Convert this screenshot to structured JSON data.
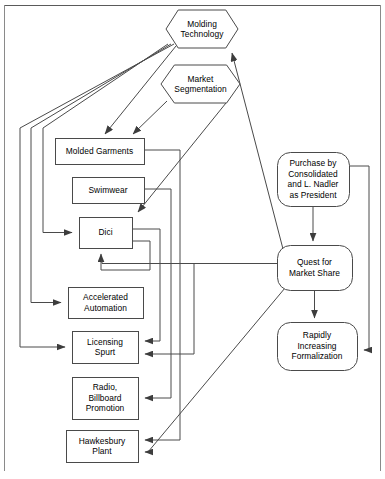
{
  "diagram": {
    "type": "flow-diagram",
    "stroke_color": "#4a4a4a",
    "text_color": "#000000",
    "background_color": "#ffffff",
    "nodes": [
      {
        "id": "molding_technology",
        "label": "Molding\nTechnology",
        "shape": "hexagon",
        "x": 166,
        "y": 10,
        "w": 72,
        "h": 38
      },
      {
        "id": "market_segmentation",
        "label": "Market\nSegmentation",
        "shape": "hexagon",
        "x": 161,
        "y": 65,
        "w": 79,
        "h": 38
      },
      {
        "id": "molded_garments",
        "label": "Molded Garments",
        "shape": "rect",
        "x": 55,
        "y": 138,
        "w": 89,
        "h": 26
      },
      {
        "id": "swimwear",
        "label": "Swimwear",
        "shape": "rect",
        "x": 72,
        "y": 177,
        "w": 72,
        "h": 26
      },
      {
        "id": "dici",
        "label": "Dici",
        "shape": "rect",
        "x": 79,
        "y": 217,
        "w": 53,
        "h": 31
      },
      {
        "id": "accelerated_automation",
        "label": "Accelerated\nAutomation",
        "shape": "rect",
        "x": 68,
        "y": 287,
        "w": 75,
        "h": 31
      },
      {
        "id": "licensing_spurt",
        "label": "Licensing\nSpurt",
        "shape": "rect",
        "x": 72,
        "y": 331,
        "w": 66,
        "h": 32
      },
      {
        "id": "radio_billboard",
        "label": "Radio,\nBillboard\nPromotion",
        "shape": "rect",
        "x": 72,
        "y": 377,
        "w": 66,
        "h": 42
      },
      {
        "id": "hawkesbury_plant",
        "label": "Hawkesbury\nPlant",
        "shape": "rect",
        "x": 66,
        "y": 430,
        "w": 72,
        "h": 32
      },
      {
        "id": "purchase_consolidated",
        "label": "Purchase by\nConsolidated\nand L. Nadler\nas President",
        "shape": "rounded",
        "x": 277,
        "y": 152,
        "w": 72,
        "h": 54
      },
      {
        "id": "quest_market_share",
        "label": "Quest for\nMarket Share",
        "shape": "rounded",
        "x": 277,
        "y": 245,
        "w": 75,
        "h": 45
      },
      {
        "id": "rapidly_formalization",
        "label": "Rapidly\nIncreasing\nFormalization",
        "shape": "rounded",
        "x": 277,
        "y": 322,
        "w": 80,
        "h": 48
      }
    ],
    "edges": [
      {
        "from": "molding_technology",
        "to": "molded_garments",
        "kind": "diagonal-arrow"
      },
      {
        "from": "market_segmentation",
        "to": "molded_garments",
        "kind": "diagonal-arrow"
      },
      {
        "from": "market_segmentation",
        "to": "dici",
        "kind": "diagonal-arrow"
      },
      {
        "from": "molding_technology",
        "to": "dici",
        "kind": "left-routed-arrow"
      },
      {
        "from": "molding_technology",
        "to": "accelerated_automation",
        "kind": "left-routed-arrow"
      },
      {
        "from": "molding_technology",
        "to": "licensing_spurt",
        "kind": "left-routed-arrow"
      },
      {
        "from": "molded_garments",
        "to": "hawkesbury_plant",
        "kind": "right-routed-arrow"
      },
      {
        "from": "swimwear",
        "to": "radio_billboard",
        "kind": "right-routed-arrow"
      },
      {
        "from": "dici",
        "to": "licensing_spurt",
        "kind": "right-routed-arrow"
      },
      {
        "from": "dici",
        "to": "dici",
        "kind": "feedback-arrow"
      },
      {
        "from": "quest_market_share",
        "to": "dici",
        "kind": "horizontal-arrow"
      },
      {
        "from": "quest_market_share",
        "to": "licensing_spurt",
        "kind": "right-routed-arrow"
      },
      {
        "from": "quest_market_share",
        "to": "hawkesbury_plant",
        "kind": "diagonal-arrow"
      },
      {
        "from": "quest_market_share",
        "to": "molding_technology",
        "kind": "diagonal-arrow"
      },
      {
        "from": "purchase_consolidated",
        "to": "quest_market_share",
        "kind": "vertical-arrow"
      },
      {
        "from": "quest_market_share",
        "to": "rapidly_formalization",
        "kind": "vertical-arrow"
      },
      {
        "from": "purchase_consolidated",
        "to": "rapidly_formalization",
        "kind": "right-routed-arrow"
      }
    ]
  }
}
